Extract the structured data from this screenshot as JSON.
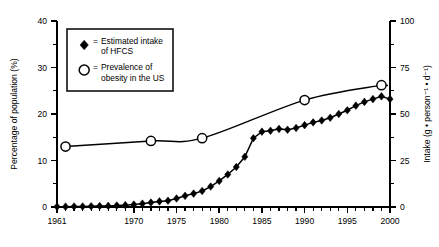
{
  "chart_data": {
    "type": "line",
    "title": "",
    "xlabel": "",
    "ylabel": "Percentage of population (%)",
    "y2label": "Intake (g • person⁻¹ • d⁻¹)",
    "xlim": [
      1961,
      2000
    ],
    "ylim": [
      0,
      40
    ],
    "y2lim": [
      0,
      100
    ],
    "grid": false,
    "legend_position": "upper-left-inset",
    "xticks_labeled": [
      "1961",
      "1970",
      "1975",
      "1980",
      "1985",
      "1990",
      "1995",
      "2000"
    ],
    "xtick_values": [
      1961,
      1970,
      1975,
      1980,
      1985,
      1990,
      1995,
      2000
    ],
    "yticks_left": [
      "0",
      "10",
      "20",
      "30",
      "40"
    ],
    "ytick_left_values": [
      0,
      10,
      20,
      30,
      40
    ],
    "yticks_right": [
      "0",
      "25",
      "50",
      "75",
      "100"
    ],
    "ytick_right_values": [
      0,
      25,
      50,
      75,
      100
    ],
    "series": [
      {
        "name": "Estimated intake of HFCS",
        "marker": "diamond",
        "axis": "right",
        "units": "g • person⁻¹ • d⁻¹",
        "x": [
          1961,
          1962,
          1963,
          1964,
          1965,
          1966,
          1967,
          1968,
          1969,
          1970,
          1971,
          1972,
          1973,
          1974,
          1975,
          1976,
          1977,
          1978,
          1979,
          1980,
          1981,
          1982,
          1983,
          1984,
          1985,
          1986,
          1987,
          1988,
          1989,
          1990,
          1991,
          1992,
          1993,
          1994,
          1995,
          1996,
          1997,
          1998,
          1999,
          2000
        ],
        "values": [
          0.2,
          0.2,
          0.3,
          0.3,
          0.4,
          0.5,
          0.6,
          0.8,
          1.0,
          1.3,
          1.8,
          2.4,
          3.0,
          3.4,
          4.6,
          6.0,
          7.2,
          8.6,
          11.0,
          14.0,
          17.5,
          21.5,
          27.0,
          37.0,
          40.5,
          41.0,
          42.0,
          41.5,
          42.5,
          44.0,
          45.5,
          46.5,
          48.0,
          50.0,
          52.0,
          54.5,
          56.5,
          58.0,
          59.5,
          58.0
        ]
      },
      {
        "name": "Prevalence of obesity in the US",
        "marker": "circle",
        "axis": "left",
        "units": "%",
        "x": [
          1962,
          1972,
          1978,
          1990,
          1999
        ],
        "values": [
          13.0,
          14.2,
          14.8,
          23.0,
          26.2
        ]
      }
    ],
    "legend": [
      {
        "marker": "diamond",
        "eq": "=",
        "line1": "Estimated intake",
        "line2": "of HFCS"
      },
      {
        "marker": "circle",
        "eq": "=",
        "line1": "Prevalence of",
        "line2": "obesity in the US"
      }
    ],
    "colors": {
      "ink": "#000000",
      "background": "#ffffff"
    }
  }
}
